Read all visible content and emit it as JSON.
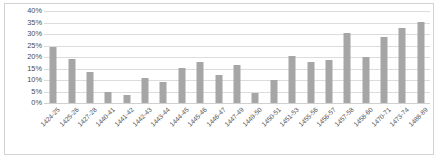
{
  "chart_data": {
    "type": "bar",
    "title": "",
    "subtitle": "",
    "xlabel": "",
    "ylabel": "",
    "ylim": [
      0,
      40
    ],
    "ytick_labels": [
      "0%",
      "5%",
      "10%",
      "15%",
      "20%",
      "25%",
      "30%",
      "35%",
      "40%"
    ],
    "ytick_values": [
      0,
      5,
      10,
      15,
      20,
      25,
      30,
      35,
      40
    ],
    "grid": true,
    "legend": false,
    "legend_position": "none",
    "bar_color": "#a6a6a6",
    "gridline_color": "#dcdcdc",
    "border_color": "#d2d2d2",
    "value_unit": "%",
    "categories": [
      "1424-25",
      "1425-26",
      "1427-28",
      "1440-41",
      "1441-42",
      "1442-43",
      "1443-44",
      "1444-45",
      "1445-46",
      "1446-47",
      "1447-49",
      "1449-50",
      "1450-51",
      "1451-53",
      "1455-56",
      "1456-57",
      "1457-58",
      "1458-60",
      "1470-71",
      "1473-74",
      "1488-89"
    ],
    "values": [
      24.2,
      19.3,
      13.4,
      4.8,
      3.7,
      10.7,
      9.1,
      15.2,
      17.9,
      12.0,
      16.6,
      4.4,
      10.1,
      20.4,
      18.0,
      18.7,
      30.5,
      19.9,
      28.5,
      32.4,
      35.4
    ]
  }
}
